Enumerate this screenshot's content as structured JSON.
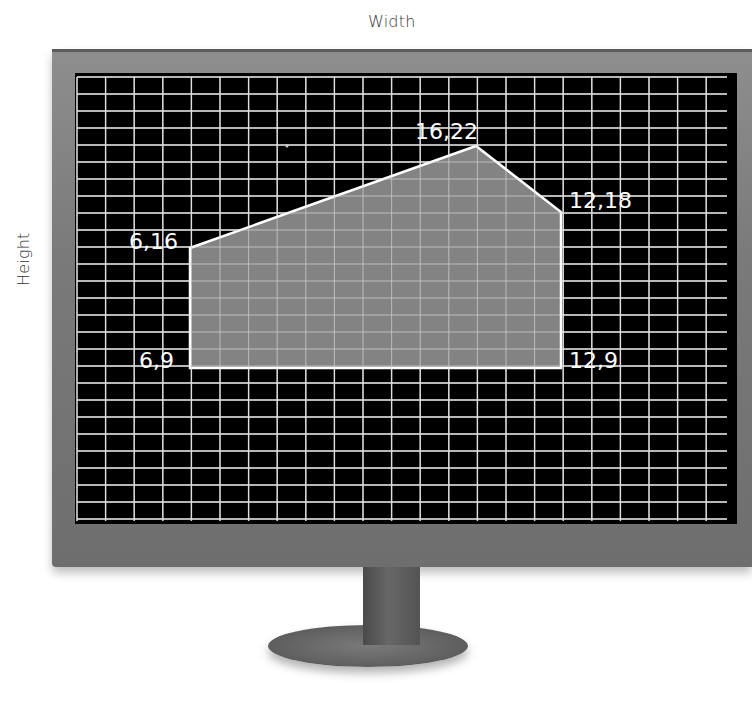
{
  "axes": {
    "x_label": "Width",
    "y_label": "Height"
  },
  "monitor": {
    "screen_color": "#000000",
    "grid_color": "#e6e6e6",
    "bezel_color": "#7d7d7d"
  },
  "shape": {
    "fill_color": "#8a8a8a",
    "stroke_color": "#ffffff",
    "vertices": [
      {
        "label": "6,16",
        "x": 6,
        "y": 16
      },
      {
        "label": "16,22",
        "x": 16,
        "y": 22
      },
      {
        "label": "12,18",
        "x": 12,
        "y": 18
      },
      {
        "label": "12,9",
        "x": 12,
        "y": 9
      },
      {
        "label": "6,9",
        "x": 6,
        "y": 9
      }
    ]
  },
  "chart_data": {
    "type": "scatter",
    "title": "",
    "xlabel": "Width",
    "ylabel": "Height",
    "grid": true,
    "points": [
      {
        "label": "6,16",
        "x": 6,
        "y": 16
      },
      {
        "label": "16,22",
        "x": 16,
        "y": 22
      },
      {
        "label": "12,18",
        "x": 12,
        "y": 18
      },
      {
        "label": "12,9",
        "x": 12,
        "y": 9
      },
      {
        "label": "6,9",
        "x": 6,
        "y": 9
      }
    ],
    "polygon_order": [
      "6,9",
      "6,16",
      "16,22",
      "12,18",
      "12,9"
    ]
  }
}
